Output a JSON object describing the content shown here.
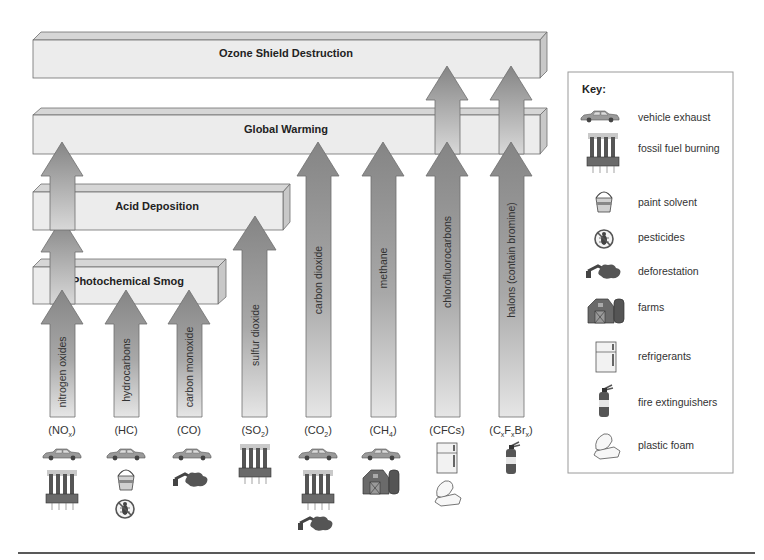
{
  "diagram": {
    "effects": [
      {
        "id": "ozone",
        "label": "Ozone Shield Destruction"
      },
      {
        "id": "warming",
        "label": "Global Warming"
      },
      {
        "id": "acid",
        "label": "Acid Deposition"
      },
      {
        "id": "smog",
        "label": "Photochemical Smog"
      }
    ],
    "pollutants": [
      {
        "name": "nitrogen oxides",
        "formula_base": "(NO",
        "formula_sub": "x",
        "formula_end": ")",
        "effects": [
          "smog",
          "acid",
          "warming"
        ],
        "sources": [
          "vehicle exhaust",
          "fossil fuel burning"
        ]
      },
      {
        "name": "hydrocarbons",
        "formula_base": "(HC)",
        "formula_sub": "",
        "formula_end": "",
        "effects": [
          "smog"
        ],
        "sources": [
          "vehicle exhaust",
          "paint solvent",
          "pesticides"
        ]
      },
      {
        "name": "carbon monoxide",
        "formula_base": "(CO)",
        "formula_sub": "",
        "formula_end": "",
        "effects": [
          "smog"
        ],
        "sources": [
          "vehicle exhaust",
          "deforestation"
        ]
      },
      {
        "name": "sulfur dioxide",
        "formula_base": "(SO",
        "formula_sub": "2",
        "formula_end": ")",
        "effects": [
          "acid"
        ],
        "sources": [
          "fossil fuel burning"
        ]
      },
      {
        "name": "carbon dioxide",
        "formula_base": "(CO",
        "formula_sub": "2",
        "formula_end": ")",
        "effects": [
          "warming"
        ],
        "sources": [
          "vehicle exhaust",
          "fossil fuel burning",
          "deforestation"
        ]
      },
      {
        "name": "methane",
        "formula_base": "(CH",
        "formula_sub": "4",
        "formula_end": ")",
        "effects": [
          "warming"
        ],
        "sources": [
          "vehicle exhaust",
          "farms"
        ]
      },
      {
        "name": "chlorofluorocarbons",
        "formula_base": "(CFCs)",
        "formula_sub": "",
        "formula_end": "",
        "effects": [
          "warming",
          "ozone"
        ],
        "sources": [
          "refrigerants",
          "plastic foam"
        ]
      },
      {
        "name": "halons (contain bromine)",
        "formula_base": "(C",
        "formula_sub": "x",
        "formula_mid1": "F",
        "formula_sub2": "x",
        "formula_mid2": "Br",
        "formula_sub3": "x",
        "formula_end": ")",
        "effects": [
          "warming",
          "ozone"
        ],
        "sources": [
          "fire extinguishers"
        ]
      }
    ],
    "key": {
      "title": "Key:",
      "items": [
        {
          "icon": "car-icon",
          "label": "vehicle exhaust"
        },
        {
          "icon": "smokestack-icon",
          "label": "fossil fuel burning"
        },
        {
          "icon": "paint-bucket-icon",
          "label": "paint solvent"
        },
        {
          "icon": "no-bug-icon",
          "label": "pesticides"
        },
        {
          "icon": "deforestation-icon",
          "label": "deforestation"
        },
        {
          "icon": "barn-icon",
          "label": "farms"
        },
        {
          "icon": "refrigerator-icon",
          "label": "refrigerants"
        },
        {
          "icon": "fire-extinguisher-icon",
          "label": "fire extinguishers"
        },
        {
          "icon": "foam-container-icon",
          "label": "plastic foam"
        }
      ]
    },
    "colors": {
      "bar_front": "#ececec",
      "bar_top": "#d6d6d6",
      "bar_side": "#c8c8c8",
      "arrow_dark": "#858585",
      "arrow_light": "#e6e6e6",
      "outline": "#6e6e6e"
    }
  }
}
